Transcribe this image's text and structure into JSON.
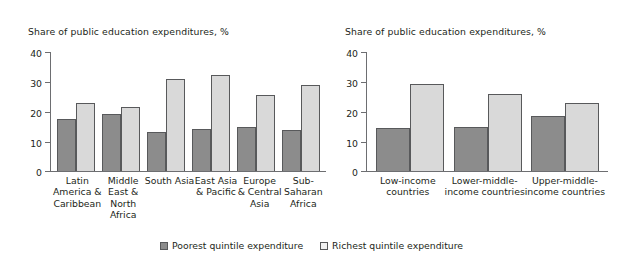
{
  "chart_data": [
    {
      "type": "bar",
      "panel": "left",
      "title": "Share of public education expenditures, %",
      "xlabel": "",
      "ylabel": "",
      "ylim": [
        0,
        40
      ],
      "yticks": [
        0,
        10,
        20,
        30,
        40
      ],
      "grid": false,
      "legend_position": "bottom-center",
      "categories": [
        "Latin America & Caribbean",
        "Middle East & North Africa",
        "South Asia",
        "East Asia & Pacific",
        "Europe & Central Asia",
        "Sub-Saharan Africa"
      ],
      "category_lines": [
        [
          "Latin",
          "America &",
          "Caribbean"
        ],
        [
          "Middle",
          "East &",
          "North",
          "Africa"
        ],
        [
          "South Asia"
        ],
        [
          "East Asia",
          "& Pacific"
        ],
        [
          "Europe",
          "& Central",
          "Asia"
        ],
        [
          "Sub-",
          "Saharan",
          "Africa"
        ]
      ],
      "series": [
        {
          "name": "Poorest quintile expenditure",
          "color": "#8c8c8c",
          "values": [
            17.5,
            19.0,
            13.0,
            14.0,
            14.7,
            13.7
          ]
        },
        {
          "name": "Richest quintile expenditure",
          "color": "#d9d9d9",
          "values": [
            22.7,
            21.5,
            30.7,
            32.0,
            25.5,
            28.6
          ]
        }
      ]
    },
    {
      "type": "bar",
      "panel": "right",
      "title": "Share of public education expenditures, %",
      "xlabel": "",
      "ylabel": "",
      "ylim": [
        0,
        40
      ],
      "yticks": [
        0,
        10,
        20,
        30,
        40
      ],
      "grid": false,
      "legend_position": "bottom-center",
      "categories": [
        "Low-income countries",
        "Lower-middle-income countries",
        "Upper-middle-income countries"
      ],
      "category_lines": [
        [
          "Low-income",
          "countries"
        ],
        [
          "Lower-middle-",
          "income countries"
        ],
        [
          "Upper-middle-",
          "income countries"
        ]
      ],
      "series": [
        {
          "name": "Poorest quintile expenditure",
          "color": "#8c8c8c",
          "values": [
            14.2,
            14.7,
            18.3
          ]
        },
        {
          "name": "Richest quintile expenditure",
          "color": "#d9d9d9",
          "values": [
            29.0,
            25.7,
            22.7
          ]
        }
      ]
    }
  ],
  "legend": {
    "items": [
      {
        "label": "Poorest quintile expenditure"
      },
      {
        "label": "Richest quintile expenditure"
      }
    ]
  },
  "axis": {
    "tick_labels": [
      "40",
      "30",
      "20",
      "10",
      "0"
    ]
  }
}
